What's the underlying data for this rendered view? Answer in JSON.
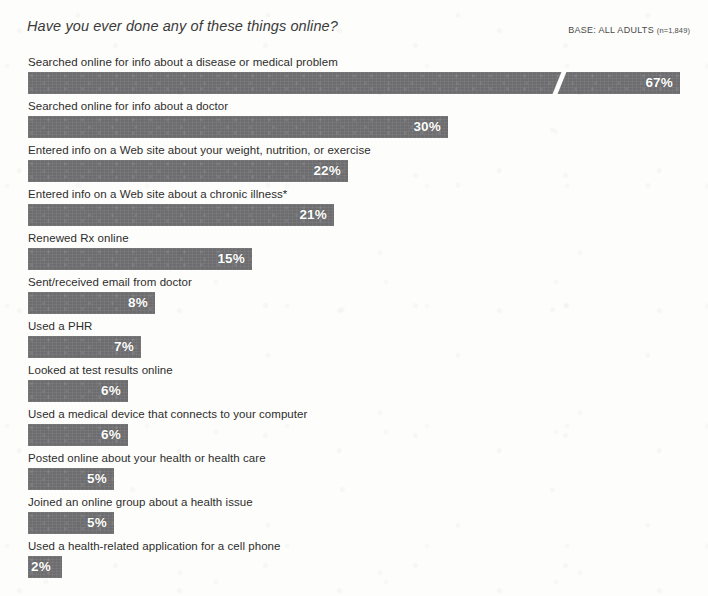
{
  "header": {
    "title": "Have you ever done any of these things online?",
    "base_prefix": "BASE: ALL ADULTS",
    "base_n": "(n=1,849)"
  },
  "chart_data": {
    "type": "bar",
    "orientation": "horizontal",
    "title": "Have you ever done any of these things online?",
    "subtitle": "BASE: ALL ADULTS (n=1,849)",
    "xlabel": "",
    "ylabel": "",
    "xlim": [
      0,
      67
    ],
    "grid": false,
    "legend": null,
    "value_suffix": "%",
    "axis_break": {
      "present": true,
      "category": "Searched online for info about a disease or medical problem",
      "note": "diagonal white break drawn through the longest bar"
    },
    "footnote_marker": "*",
    "categories": [
      "Searched online for info about a disease or medical problem",
      "Searched online for info about a doctor",
      "Entered info on a Web site about your weight, nutrition, or exercise",
      "Entered info on a Web site about a chronic illness*",
      "Renewed Rx online",
      "Sent/received email from doctor",
      "Used a PHR",
      "Looked at test results online",
      "Used a medical device that connects to your computer",
      "Posted online about your health or health care",
      "Joined an online group about a health issue",
      "Used a health-related application for a cell phone"
    ],
    "values": [
      67,
      30,
      22,
      21,
      15,
      8,
      7,
      6,
      6,
      5,
      5,
      2
    ],
    "value_labels": [
      "67%",
      "30%",
      "22%",
      "21%",
      "15%",
      "8%",
      "7%",
      "6%",
      "6%",
      "5%",
      "5%",
      "2%"
    ],
    "colors": {
      "bar": "#6d6d6f",
      "value_text": "#ffffff",
      "label_text": "#2d2d2d",
      "background": "#fdfdfb"
    }
  },
  "rows": [
    {
      "label": "Searched online for info about a disease or medical problem",
      "value_label": "67%",
      "bar_px": 652,
      "top": 6,
      "broken": true,
      "break_px": 521,
      "tiny": false
    },
    {
      "label": "Searched online for info about a doctor",
      "value_label": "30%",
      "bar_px": 420,
      "top": 50,
      "broken": false,
      "tiny": false
    },
    {
      "label": "Entered info on a Web site about your weight, nutrition, or exercise",
      "value_label": "22%",
      "bar_px": 320,
      "top": 94,
      "broken": false,
      "tiny": false
    },
    {
      "label": "Entered info on a Web site about a chronic illness*",
      "value_label": "21%",
      "bar_px": 306,
      "top": 138,
      "broken": false,
      "tiny": false
    },
    {
      "label": "Renewed Rx online",
      "value_label": "15%",
      "bar_px": 224,
      "top": 182,
      "broken": false,
      "tiny": false
    },
    {
      "label": "Sent/received email from doctor",
      "value_label": "8%",
      "bar_px": 127,
      "top": 226,
      "broken": false,
      "tiny": false
    },
    {
      "label": "Used a PHR",
      "value_label": "7%",
      "bar_px": 113,
      "top": 270,
      "broken": false,
      "tiny": false
    },
    {
      "label": "Looked at test results online",
      "value_label": "6%",
      "bar_px": 100,
      "top": 314,
      "broken": false,
      "tiny": false
    },
    {
      "label": "Used a medical device that connects to your computer",
      "value_label": "6%",
      "bar_px": 100,
      "top": 358,
      "broken": false,
      "tiny": false
    },
    {
      "label": "Posted online about your health or health care",
      "value_label": "5%",
      "bar_px": 86,
      "top": 402,
      "broken": false,
      "tiny": false
    },
    {
      "label": "Joined an online group about a health issue",
      "value_label": "5%",
      "bar_px": 86,
      "top": 446,
      "broken": false,
      "tiny": false
    },
    {
      "label": "Used a health-related application for a cell phone",
      "value_label": "2%",
      "bar_px": 34,
      "top": 490,
      "broken": false,
      "tiny": true
    }
  ]
}
